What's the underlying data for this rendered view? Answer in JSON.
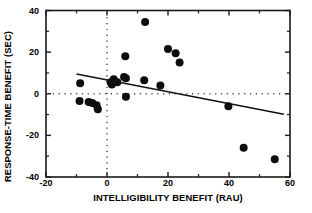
{
  "chart_data": {
    "type": "scatter",
    "title": "",
    "xlabel": "INTELLIGIBILITY BENEFIT (RAU)",
    "ylabel": "RESPONSE-TIME BENEFIT (SEC)",
    "xlim": [
      -20,
      60
    ],
    "ylim": [
      -40,
      40
    ],
    "xticks": [
      -20,
      0,
      20,
      40,
      60
    ],
    "yticks": [
      -40,
      -20,
      0,
      20,
      40
    ],
    "xtick_labels": [
      "-20",
      "0",
      "20",
      "40",
      "60"
    ],
    "ytick_labels": [
      "-40",
      "-20",
      "0",
      "20",
      "40"
    ],
    "xminor_ticks": [
      -10,
      10,
      30,
      50
    ],
    "yminor_ticks": [
      -30,
      -10,
      10,
      30
    ],
    "grid": false,
    "legend": null,
    "marker": "filled-circle",
    "marker_color": "#0d0d0d",
    "marker_size_px": 8,
    "reference_lines": [
      {
        "name": "zero-horizontal",
        "axis": "y",
        "value": 0,
        "style": "dotted"
      },
      {
        "name": "zero-vertical",
        "axis": "x",
        "value": 0,
        "style": "dotted"
      }
    ],
    "fit_line": {
      "name": "regression-line",
      "style": "solid",
      "x_start": -10.0,
      "y_start": 9.5,
      "x_end": 58.0,
      "y_end": -9.8
    },
    "points": [
      {
        "x": -8.8,
        "y": 5.0
      },
      {
        "x": -9.0,
        "y": -3.5
      },
      {
        "x": -6.0,
        "y": -4.0
      },
      {
        "x": -4.8,
        "y": -4.5
      },
      {
        "x": -3.4,
        "y": -5.5
      },
      {
        "x": -3.0,
        "y": -7.5
      },
      {
        "x": 1.2,
        "y": 5.5
      },
      {
        "x": 1.6,
        "y": 4.5
      },
      {
        "x": 2.2,
        "y": 7.0
      },
      {
        "x": 3.4,
        "y": 5.5
      },
      {
        "x": 5.6,
        "y": 8.0
      },
      {
        "x": 6.2,
        "y": 7.5
      },
      {
        "x": 6.0,
        "y": 18.0
      },
      {
        "x": 6.2,
        "y": -1.5
      },
      {
        "x": 12.2,
        "y": 6.5
      },
      {
        "x": 12.5,
        "y": 34.5
      },
      {
        "x": 17.5,
        "y": 4.0
      },
      {
        "x": 20.0,
        "y": 21.5
      },
      {
        "x": 22.5,
        "y": 19.5
      },
      {
        "x": 23.8,
        "y": 15.0
      },
      {
        "x": 39.8,
        "y": -6.0
      },
      {
        "x": 44.8,
        "y": -26.0
      },
      {
        "x": 55.0,
        "y": -31.5
      }
    ]
  },
  "axes": {
    "frame_color": "#1a1a1a",
    "dotted_color": "#4d4d4d"
  }
}
